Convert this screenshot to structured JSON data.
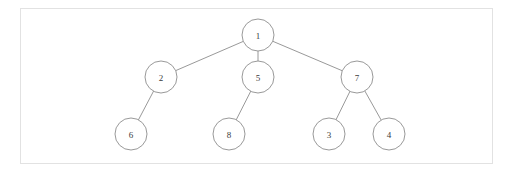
{
  "figure": {
    "type": "tree-diagram",
    "title": "",
    "background_color": "#ffffff",
    "frame": {
      "border_color": "#e2e2e2",
      "fill_color": "#ffffff",
      "x": 20,
      "y": 8,
      "width": 473,
      "height": 156
    },
    "style": {
      "node_stroke_color": "#8d8d8d",
      "node_fill_color": "#ffffff",
      "edge_stroke_color": "#8d8d8d",
      "label_color": "#3b3b3b",
      "node_radius": 16
    }
  },
  "chart_data": {
    "type": "diagram",
    "subtype": "tree",
    "title": "",
    "nodes": [
      {
        "id": "n1",
        "label": "1",
        "x": 258,
        "y": 35,
        "r": 16,
        "level": 0
      },
      {
        "id": "n2",
        "label": "2",
        "x": 161,
        "y": 77,
        "r": 16,
        "level": 1
      },
      {
        "id": "n5",
        "label": "5",
        "x": 258,
        "y": 77,
        "r": 16,
        "level": 1
      },
      {
        "id": "n7",
        "label": "7",
        "x": 357,
        "y": 77,
        "r": 16,
        "level": 1
      },
      {
        "id": "n6",
        "label": "6",
        "x": 131,
        "y": 134,
        "r": 16,
        "level": 2
      },
      {
        "id": "n8",
        "label": "8",
        "x": 229,
        "y": 134,
        "r": 16,
        "level": 2
      },
      {
        "id": "n3",
        "label": "3",
        "x": 329,
        "y": 134,
        "r": 16,
        "level": 2
      },
      {
        "id": "n4",
        "label": "4",
        "x": 389,
        "y": 134,
        "r": 16,
        "level": 2
      }
    ],
    "edges": [
      {
        "from": "n1",
        "to": "n2"
      },
      {
        "from": "n1",
        "to": "n5"
      },
      {
        "from": "n1",
        "to": "n7"
      },
      {
        "from": "n2",
        "to": "n6"
      },
      {
        "from": "n5",
        "to": "n8"
      },
      {
        "from": "n7",
        "to": "n3"
      },
      {
        "from": "n7",
        "to": "n4"
      }
    ],
    "root": "n1",
    "node_count": 8,
    "edge_count": 7
  }
}
